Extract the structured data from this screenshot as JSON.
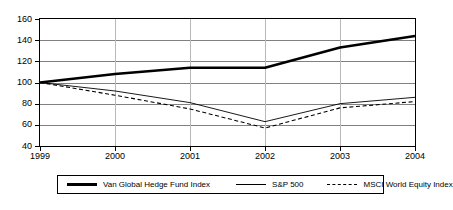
{
  "chart_data": {
    "type": "line",
    "title": "",
    "subtitle": "",
    "xlabel": "",
    "ylabel": "",
    "x": [
      1999,
      2000,
      2001,
      2002,
      2003,
      2004
    ],
    "categories": [
      "1999",
      "2000",
      "2001",
      "2002",
      "2003",
      "2004"
    ],
    "xlim": [
      1999,
      2004
    ],
    "ylim": [
      40,
      160
    ],
    "ytick_labels": [
      "40",
      "60",
      "80",
      "100",
      "120",
      "140",
      "160"
    ],
    "ytick_values": [
      40,
      60,
      80,
      100,
      120,
      140,
      160
    ],
    "grid": true,
    "legend_position": "bottom",
    "series": [
      {
        "name": "Van Global Hedge Fund Index",
        "style": "thick-solid",
        "color": "#000000",
        "values": [
          100,
          108,
          114,
          114,
          133,
          144
        ]
      },
      {
        "name": "S&P 500",
        "style": "thin-solid",
        "color": "#000000",
        "values": [
          100,
          92,
          81,
          63,
          80,
          86
        ]
      },
      {
        "name": "MSCI World Equity Index",
        "style": "dashed",
        "color": "#000000",
        "values": [
          100,
          88,
          75,
          57,
          76,
          82
        ]
      }
    ]
  },
  "legend": {
    "entries": [
      {
        "label": "Van Global Hedge Fund Index",
        "swatch": "thick-line-icon"
      },
      {
        "label": "S&P 500",
        "swatch": "thin-line-icon"
      },
      {
        "label": "MSCI World Equity Index",
        "swatch": "dashed-line-icon"
      }
    ]
  }
}
